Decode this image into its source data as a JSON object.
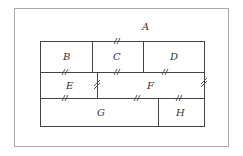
{
  "diagram": {
    "outer_region": {
      "label": "A"
    },
    "regions": [
      {
        "id": "B",
        "label": "B"
      },
      {
        "id": "C",
        "label": "C"
      },
      {
        "id": "D",
        "label": "D"
      },
      {
        "id": "E",
        "label": "E"
      },
      {
        "id": "F",
        "label": "F"
      },
      {
        "id": "G",
        "label": "G"
      },
      {
        "id": "H",
        "label": "H"
      }
    ],
    "break_marks": [
      {
        "between": [
          "A",
          "C"
        ]
      },
      {
        "between": [
          "B",
          "E"
        ]
      },
      {
        "between": [
          "C",
          "F"
        ]
      },
      {
        "between": [
          "D",
          "F"
        ]
      },
      {
        "between": [
          "E",
          "F"
        ]
      },
      {
        "between": [
          "F",
          "A"
        ]
      },
      {
        "between": [
          "E",
          "G"
        ]
      },
      {
        "between": [
          "F",
          "G"
        ]
      },
      {
        "between": [
          "F",
          "H"
        ]
      }
    ],
    "colors": {
      "line": "#444444",
      "frame": "#aaaaaa",
      "background": "#ffffff"
    }
  }
}
